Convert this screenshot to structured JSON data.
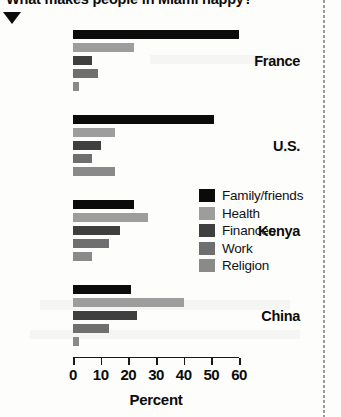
{
  "headline": {
    "text": "What makes people in Miami happy?",
    "marker_icon": "down-triangle-icon"
  },
  "chart_data": {
    "type": "bar",
    "orientation": "horizontal",
    "title": "What makes people in Miami happy?",
    "xlabel": "Percent",
    "ylabel": "",
    "xlim": [
      0,
      60
    ],
    "xticks": [
      0,
      10,
      20,
      30,
      40,
      50,
      60
    ],
    "grid": false,
    "legend_position": "center-right",
    "categories": [
      "France",
      "U.S.",
      "Kenya",
      "China"
    ],
    "series": [
      {
        "name": "Family/friends",
        "color": "#0b0b0b",
        "values": [
          60,
          51,
          22,
          21
        ]
      },
      {
        "name": "Health",
        "color": "#9d9d9d",
        "values": [
          22,
          15,
          27,
          40
        ]
      },
      {
        "name": "Finances",
        "color": "#3f3f3f",
        "values": [
          7,
          10,
          17,
          23
        ]
      },
      {
        "name": "Work",
        "color": "#6f6f6f",
        "values": [
          9,
          7,
          13,
          13
        ]
      },
      {
        "name": "Religion",
        "color": "#8a8a8a",
        "values": [
          2,
          15,
          7,
          2
        ]
      }
    ]
  },
  "legend": {
    "items": [
      {
        "label": "Family/friends",
        "color": "#0b0b0b",
        "swatch_icon": "legend-swatch-icon"
      },
      {
        "label": "Health",
        "color": "#9d9d9d",
        "swatch_icon": "legend-swatch-icon"
      },
      {
        "label": "Finances",
        "color": "#3f3f3f",
        "swatch_icon": "legend-swatch-icon"
      },
      {
        "label": "Work",
        "color": "#6f6f6f",
        "swatch_icon": "legend-swatch-icon"
      },
      {
        "label": "Religion",
        "color": "#8a8a8a",
        "swatch_icon": "legend-swatch-icon"
      }
    ]
  }
}
